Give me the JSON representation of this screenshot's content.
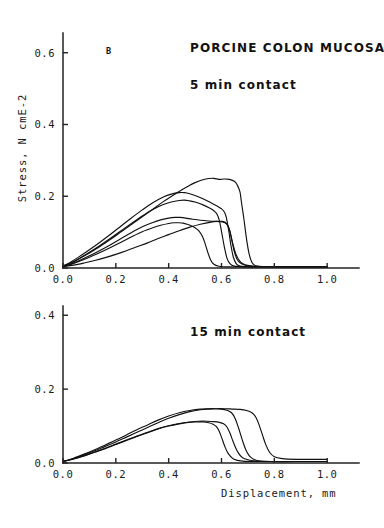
{
  "figure": {
    "panel_label": "B",
    "title": "PORCINE COLON MUCOSA",
    "background_color": "#ffffff",
    "line_color": "#111111"
  },
  "chart_data": [
    {
      "type": "line",
      "panel": "top",
      "title": "PORCINE COLON MUCOSA",
      "annotation": "5 min contact",
      "panel_letter": "B",
      "xlabel": "",
      "ylabel": "Stress, N cmE-2",
      "xlim": [
        0.0,
        1.06
      ],
      "ylim": [
        0.0,
        0.655
      ],
      "xticks": [
        0.0,
        0.2,
        0.4,
        0.6,
        0.8,
        1.0
      ],
      "xticklabels": [
        "0.0",
        "0.2",
        "0.4",
        "0.6",
        "0.8",
        "1.0"
      ],
      "yticks": [
        0.0,
        0.2,
        0.4,
        0.6
      ],
      "yticklabels": [
        "0.0",
        "0.2",
        "0.4",
        "0.6"
      ],
      "grid": false,
      "legend": "none",
      "series": [
        {
          "name": "curve-1",
          "x": [
            0.0,
            0.03,
            0.06,
            0.1,
            0.14,
            0.18,
            0.22,
            0.26,
            0.3,
            0.34,
            0.38,
            0.42,
            0.46,
            0.5,
            0.54,
            0.57,
            0.59,
            0.61,
            0.63,
            0.65,
            0.66,
            0.67,
            0.675,
            0.685,
            0.695,
            0.705,
            0.715,
            0.725,
            0.74,
            0.78,
            0.88,
            1.0
          ],
          "y": [
            0.005,
            0.014,
            0.025,
            0.042,
            0.06,
            0.08,
            0.101,
            0.122,
            0.143,
            0.164,
            0.185,
            0.204,
            0.222,
            0.238,
            0.248,
            0.25,
            0.247,
            0.248,
            0.247,
            0.241,
            0.231,
            0.212,
            0.186,
            0.136,
            0.08,
            0.038,
            0.016,
            0.008,
            0.005,
            0.004,
            0.004,
            0.004
          ]
        },
        {
          "name": "curve-2",
          "x": [
            0.0,
            0.03,
            0.06,
            0.1,
            0.14,
            0.18,
            0.22,
            0.26,
            0.3,
            0.34,
            0.38,
            0.41,
            0.44,
            0.46,
            0.48,
            0.5,
            0.53,
            0.56,
            0.585,
            0.6,
            0.61,
            0.618,
            0.627,
            0.636,
            0.645,
            0.655,
            0.665,
            0.69,
            0.74,
            0.85,
            1.0
          ],
          "y": [
            0.005,
            0.017,
            0.031,
            0.051,
            0.072,
            0.094,
            0.117,
            0.14,
            0.162,
            0.182,
            0.198,
            0.206,
            0.21,
            0.21,
            0.207,
            0.202,
            0.193,
            0.182,
            0.172,
            0.165,
            0.157,
            0.142,
            0.106,
            0.062,
            0.03,
            0.013,
            0.007,
            0.004,
            0.003,
            0.003,
            0.003
          ]
        },
        {
          "name": "curve-3",
          "x": [
            0.0,
            0.03,
            0.06,
            0.1,
            0.14,
            0.18,
            0.22,
            0.26,
            0.3,
            0.34,
            0.38,
            0.41,
            0.44,
            0.46,
            0.48,
            0.5,
            0.53,
            0.555,
            0.572,
            0.583,
            0.592,
            0.601,
            0.611,
            0.621,
            0.632,
            0.645,
            0.67,
            0.72,
            0.82,
            1.0
          ],
          "y": [
            0.005,
            0.014,
            0.026,
            0.044,
            0.063,
            0.083,
            0.104,
            0.125,
            0.145,
            0.163,
            0.177,
            0.184,
            0.188,
            0.189,
            0.187,
            0.184,
            0.176,
            0.167,
            0.159,
            0.15,
            0.132,
            0.098,
            0.058,
            0.027,
            0.012,
            0.006,
            0.004,
            0.003,
            0.003,
            0.003
          ]
        },
        {
          "name": "curve-4",
          "x": [
            0.0,
            0.03,
            0.06,
            0.1,
            0.14,
            0.18,
            0.22,
            0.26,
            0.3,
            0.34,
            0.37,
            0.4,
            0.425,
            0.445,
            0.465,
            0.49,
            0.52,
            0.55,
            0.575,
            0.595,
            0.61,
            0.62,
            0.63,
            0.64,
            0.65,
            0.665,
            0.7,
            0.76,
            0.88,
            1.0
          ],
          "y": [
            0.004,
            0.011,
            0.02,
            0.034,
            0.049,
            0.065,
            0.082,
            0.099,
            0.115,
            0.127,
            0.134,
            0.139,
            0.141,
            0.141,
            0.139,
            0.136,
            0.133,
            0.131,
            0.13,
            0.129,
            0.127,
            0.122,
            0.107,
            0.075,
            0.042,
            0.018,
            0.006,
            0.004,
            0.003,
            0.003
          ]
        },
        {
          "name": "curve-5",
          "x": [
            0.0,
            0.03,
            0.06,
            0.1,
            0.14,
            0.18,
            0.22,
            0.26,
            0.3,
            0.34,
            0.37,
            0.4,
            0.42,
            0.44,
            0.455,
            0.47,
            0.485,
            0.5,
            0.515,
            0.528,
            0.538,
            0.548,
            0.558,
            0.57,
            0.59,
            0.63,
            0.72,
            0.85,
            1.0
          ],
          "y": [
            0.004,
            0.01,
            0.018,
            0.03,
            0.043,
            0.057,
            0.072,
            0.087,
            0.101,
            0.112,
            0.119,
            0.124,
            0.126,
            0.126,
            0.125,
            0.122,
            0.118,
            0.112,
            0.103,
            0.088,
            0.068,
            0.044,
            0.024,
            0.011,
            0.005,
            0.003,
            0.003,
            0.003,
            0.003
          ]
        },
        {
          "name": "curve-6",
          "x": [
            0.0,
            0.04,
            0.08,
            0.12,
            0.16,
            0.2,
            0.24,
            0.28,
            0.32,
            0.36,
            0.4,
            0.44,
            0.48,
            0.52,
            0.56,
            0.585,
            0.6,
            0.612,
            0.622,
            0.632,
            0.642,
            0.655,
            0.675,
            0.71,
            0.78,
            0.9,
            1.0
          ],
          "y": [
            0.004,
            0.008,
            0.014,
            0.021,
            0.029,
            0.038,
            0.048,
            0.059,
            0.07,
            0.082,
            0.093,
            0.104,
            0.114,
            0.122,
            0.128,
            0.13,
            0.13,
            0.128,
            0.121,
            0.102,
            0.07,
            0.038,
            0.015,
            0.006,
            0.004,
            0.003,
            0.003
          ]
        }
      ]
    },
    {
      "type": "line",
      "panel": "bottom",
      "title": "",
      "annotation": "15 min contact",
      "xlabel": "Displacement, mm",
      "ylabel": "",
      "xlim": [
        0.0,
        1.06
      ],
      "ylim": [
        0.0,
        0.425
      ],
      "xticks": [
        0.0,
        0.2,
        0.4,
        0.6,
        0.8,
        1.0
      ],
      "xticklabels": [
        "0.0",
        "0.2",
        "0.4",
        "0.6",
        "0.8",
        "1.0"
      ],
      "yticks": [
        0.0,
        0.2,
        0.4
      ],
      "yticklabels": [
        "0.0",
        "0.2",
        "0.4"
      ],
      "grid": false,
      "legend": "none",
      "series": [
        {
          "name": "curve-1",
          "x": [
            0.0,
            0.04,
            0.08,
            0.12,
            0.16,
            0.2,
            0.24,
            0.28,
            0.32,
            0.36,
            0.4,
            0.44,
            0.48,
            0.52,
            0.55,
            0.58,
            0.61,
            0.64,
            0.67,
            0.695,
            0.715,
            0.73,
            0.742,
            0.755,
            0.768,
            0.782,
            0.8,
            0.83,
            0.88,
            0.94,
            0.97,
            1.0
          ],
          "y": [
            0.004,
            0.012,
            0.022,
            0.033,
            0.045,
            0.057,
            0.07,
            0.083,
            0.096,
            0.109,
            0.121,
            0.131,
            0.139,
            0.144,
            0.146,
            0.147,
            0.147,
            0.146,
            0.145,
            0.142,
            0.136,
            0.124,
            0.104,
            0.076,
            0.049,
            0.029,
            0.017,
            0.012,
            0.01,
            0.01,
            0.01,
            0.01
          ]
        },
        {
          "name": "curve-2",
          "x": [
            0.0,
            0.04,
            0.08,
            0.12,
            0.16,
            0.2,
            0.24,
            0.28,
            0.32,
            0.36,
            0.4,
            0.44,
            0.48,
            0.52,
            0.55,
            0.575,
            0.6,
            0.62,
            0.638,
            0.652,
            0.665,
            0.678,
            0.692,
            0.71,
            0.74,
            0.8,
            0.88,
            1.0
          ],
          "y": [
            0.004,
            0.013,
            0.024,
            0.036,
            0.049,
            0.062,
            0.076,
            0.09,
            0.103,
            0.116,
            0.127,
            0.136,
            0.142,
            0.146,
            0.147,
            0.147,
            0.146,
            0.143,
            0.136,
            0.12,
            0.094,
            0.064,
            0.036,
            0.016,
            0.006,
            0.004,
            0.004,
            0.004
          ]
        },
        {
          "name": "curve-3",
          "x": [
            0.0,
            0.04,
            0.08,
            0.12,
            0.16,
            0.2,
            0.24,
            0.28,
            0.32,
            0.36,
            0.4,
            0.44,
            0.48,
            0.515,
            0.545,
            0.57,
            0.592,
            0.608,
            0.62,
            0.632,
            0.645,
            0.66,
            0.68,
            0.72,
            0.8,
            0.9,
            1.0
          ],
          "y": [
            0.004,
            0.011,
            0.02,
            0.03,
            0.04,
            0.051,
            0.062,
            0.073,
            0.083,
            0.093,
            0.101,
            0.107,
            0.111,
            0.113,
            0.113,
            0.112,
            0.11,
            0.106,
            0.098,
            0.081,
            0.056,
            0.032,
            0.014,
            0.006,
            0.004,
            0.004,
            0.004
          ]
        },
        {
          "name": "curve-4",
          "x": [
            0.0,
            0.04,
            0.08,
            0.12,
            0.16,
            0.2,
            0.24,
            0.28,
            0.32,
            0.36,
            0.4,
            0.44,
            0.475,
            0.505,
            0.53,
            0.552,
            0.568,
            0.58,
            0.59,
            0.6,
            0.612,
            0.625,
            0.645,
            0.68,
            0.75,
            0.85,
            1.0
          ],
          "y": [
            0.004,
            0.011,
            0.019,
            0.029,
            0.039,
            0.05,
            0.061,
            0.072,
            0.082,
            0.092,
            0.1,
            0.106,
            0.11,
            0.111,
            0.111,
            0.109,
            0.105,
            0.099,
            0.088,
            0.07,
            0.046,
            0.026,
            0.011,
            0.005,
            0.004,
            0.004,
            0.004
          ]
        }
      ]
    }
  ],
  "labels": {
    "top_annotation": "5 min contact",
    "bottom_annotation": "15 min contact",
    "title": "PORCINE COLON MUCOSA",
    "panel_letter": "B",
    "y_axis_title": "Stress, N cmE-2",
    "x_axis_title": "Displacement, mm"
  }
}
